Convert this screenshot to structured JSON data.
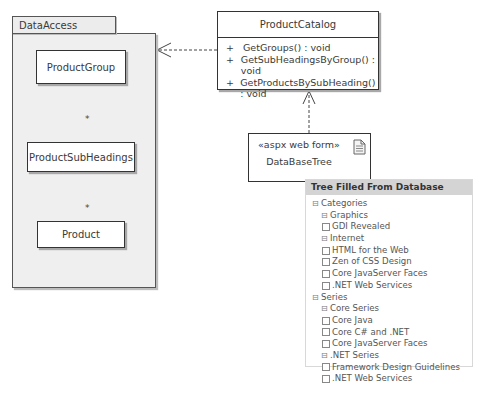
{
  "package": {
    "name": "DataAccess",
    "classes": [
      {
        "name": "ProductGroup"
      },
      {
        "name": "ProductSubHeadings"
      },
      {
        "name": "Product"
      }
    ],
    "aggregations": [
      {
        "from": "ProductGroup",
        "to": "ProductSubHeadings",
        "multiplicity": "*"
      },
      {
        "from": "ProductSubHeadings",
        "to": "Product",
        "multiplicity": "*"
      }
    ]
  },
  "catalog": {
    "name": "ProductCatalog",
    "operations": [
      {
        "visibility": "+",
        "signature": "GetGroups() : void"
      },
      {
        "visibility": "+",
        "signature": "GetSubHeadingsByGroup() : void"
      },
      {
        "visibility": "+",
        "signature": "GetProductsBySubHeading() : void"
      }
    ]
  },
  "webform": {
    "stereotype": "«aspx web form»",
    "name": "DataBaseTree",
    "icon": "document-icon"
  },
  "tree_panel": {
    "title": "Tree Filled From Database",
    "expander_symbol": "⊟",
    "nodes": [
      {
        "label": "Categories",
        "level": 0,
        "type": "expander"
      },
      {
        "label": "Graphics",
        "level": 1,
        "type": "expander"
      },
      {
        "label": "GDI Revealed",
        "level": 2,
        "type": "checkbox",
        "checked": false
      },
      {
        "label": "Internet",
        "level": 1,
        "type": "expander"
      },
      {
        "label": "HTML for the Web",
        "level": 2,
        "type": "checkbox",
        "checked": false
      },
      {
        "label": "Zen of CSS Design",
        "level": 2,
        "type": "checkbox",
        "checked": false
      },
      {
        "label": "Core JavaServer Faces",
        "level": 2,
        "type": "checkbox",
        "checked": false
      },
      {
        "label": ".NET Web Services",
        "level": 2,
        "type": "checkbox",
        "checked": false
      },
      {
        "label": "Series",
        "level": 0,
        "type": "expander"
      },
      {
        "label": "Core Series",
        "level": 1,
        "type": "expander"
      },
      {
        "label": "Core Java",
        "level": 2,
        "type": "checkbox",
        "checked": false
      },
      {
        "label": "Core C# and .NET",
        "level": 2,
        "type": "checkbox",
        "checked": false
      },
      {
        "label": "Core JavaServer Faces",
        "level": 2,
        "type": "checkbox",
        "checked": false
      },
      {
        "label": ".NET Series",
        "level": 1,
        "type": "expander"
      },
      {
        "label": "Framework Design Guidelines",
        "level": 2,
        "type": "checkbox",
        "checked": false
      },
      {
        "label": ".NET Web Services",
        "level": 2,
        "type": "checkbox",
        "checked": false
      }
    ]
  },
  "colors": {
    "line": "#333333",
    "package_fill": "#efefef",
    "tree_header": "#d4d4d4"
  }
}
